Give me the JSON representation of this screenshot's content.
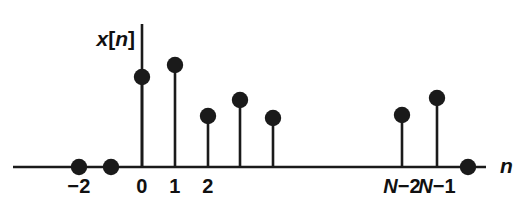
{
  "figure": {
    "width": 529,
    "height": 217,
    "background": "#ffffff",
    "ink_color": "#1a1a1a",
    "signal_label": {
      "full": "x[n]",
      "var": "x",
      "open_bracket": "[",
      "index": "n",
      "close_bracket": "]"
    },
    "axis_label": "n"
  },
  "chart_data": {
    "type": "scatter",
    "subtype": "stem-plot",
    "title": "",
    "xlabel": "n",
    "ylabel": "x[n]",
    "grid": false,
    "legend": false,
    "x": [
      "-2",
      "-1",
      "0",
      "1",
      "2",
      "3",
      "4",
      "N-2",
      "N-1",
      "N"
    ],
    "values": [
      0,
      0,
      0.73,
      0.87,
      0.5,
      0.66,
      0.48,
      0.51,
      0.69,
      0
    ],
    "xtick_labels": [
      "-2",
      "0",
      "1",
      "2",
      "N-2",
      "N-1"
    ],
    "ylim": [
      0,
      1
    ],
    "points": [
      {
        "label": "-2",
        "tick": "−2",
        "show_tick": true,
        "x_px": 79,
        "dot_y_px": 167,
        "value": 0,
        "is_zero": true
      },
      {
        "label": "-1",
        "tick": "",
        "show_tick": false,
        "x_px": 111,
        "dot_y_px": 167,
        "value": 0,
        "is_zero": true
      },
      {
        "label": "0",
        "tick": "0",
        "show_tick": true,
        "x_px": 142,
        "dot_y_px": 77,
        "value": 0.73,
        "is_zero": false
      },
      {
        "label": "1",
        "tick": "1",
        "show_tick": true,
        "x_px": 175,
        "dot_y_px": 65,
        "value": 0.87,
        "is_zero": false
      },
      {
        "label": "2",
        "tick": "2",
        "show_tick": true,
        "x_px": 208,
        "dot_y_px": 116,
        "value": 0.5,
        "is_zero": false
      },
      {
        "label": "3",
        "tick": "",
        "show_tick": false,
        "x_px": 240,
        "dot_y_px": 100,
        "value": 0.66,
        "is_zero": false
      },
      {
        "label": "4",
        "tick": "",
        "show_tick": false,
        "x_px": 273,
        "dot_y_px": 118,
        "value": 0.48,
        "is_zero": false
      },
      {
        "label": "N-2",
        "tick": "N−2",
        "show_tick": true,
        "x_px": 402,
        "dot_y_px": 115,
        "value": 0.51,
        "is_zero": false
      },
      {
        "label": "N-1",
        "tick": "N−1",
        "show_tick": true,
        "x_px": 437,
        "dot_y_px": 98,
        "value": 0.69,
        "is_zero": false
      },
      {
        "label": "N",
        "tick": "",
        "show_tick": false,
        "x_px": 468,
        "dot_y_px": 167,
        "value": 0,
        "is_zero": true
      }
    ],
    "geometry": {
      "baseline_y_px": 167,
      "axis_x_start_px": 13,
      "axis_x_end_px": 486,
      "yaxis_x_px": 142,
      "yaxis_top_px": 24,
      "dot_radius_px": 8.2,
      "tick_label_y_px": 176,
      "axis_name_x_px": 500,
      "axis_name_y_px": 155,
      "signal_label_x_px": 135,
      "signal_label_y_px": 28
    }
  }
}
